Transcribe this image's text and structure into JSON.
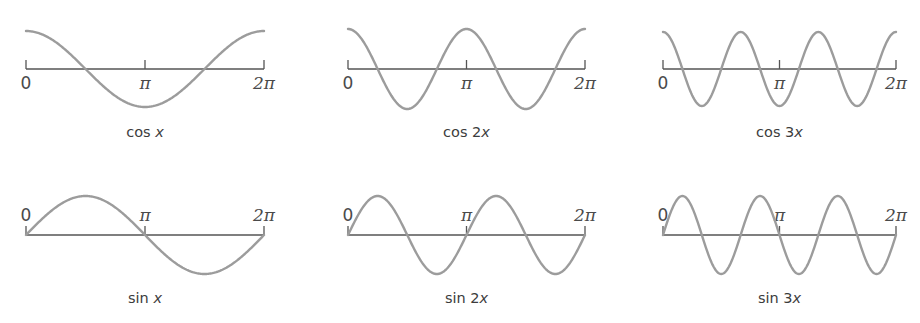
{
  "figure": {
    "colors": {
      "curve": "#9c9c9c",
      "axis": "#555555",
      "text": "#3c3c3c"
    }
  },
  "chart_data": [
    {
      "type": "line",
      "title": "cos x",
      "caption": {
        "fn": "cos",
        "coef": "",
        "var": "x"
      },
      "function": "cos",
      "frequency": 1,
      "xlim": [
        0,
        6.2832
      ],
      "ylim": [
        -1,
        1
      ],
      "x_ticks": [
        0,
        3.1416,
        6.2832
      ],
      "tick_labels": [
        "0",
        "π",
        "2π"
      ],
      "tick_label_position": "below",
      "grid": false
    },
    {
      "type": "line",
      "title": "cos 2x",
      "caption": {
        "fn": "cos",
        "coef": "2",
        "var": "x"
      },
      "function": "cos",
      "frequency": 2,
      "xlim": [
        0,
        6.2832
      ],
      "ylim": [
        -1,
        1
      ],
      "x_ticks": [
        0,
        3.1416,
        6.2832
      ],
      "tick_labels": [
        "0",
        "π",
        "2π"
      ],
      "tick_label_position": "below",
      "grid": false
    },
    {
      "type": "line",
      "title": "cos 3x",
      "caption": {
        "fn": "cos",
        "coef": "3",
        "var": "x"
      },
      "function": "cos",
      "frequency": 3,
      "xlim": [
        0,
        6.2832
      ],
      "ylim": [
        -1,
        1
      ],
      "x_ticks": [
        0,
        3.1416,
        6.2832
      ],
      "tick_labels": [
        "0",
        "π",
        "2π"
      ],
      "tick_label_position": "below",
      "grid": false
    },
    {
      "type": "line",
      "title": "sin x",
      "caption": {
        "fn": "sin",
        "coef": "",
        "var": "x"
      },
      "function": "sin",
      "frequency": 1,
      "xlim": [
        0,
        6.2832
      ],
      "ylim": [
        -1,
        1
      ],
      "x_ticks": [
        0,
        3.1416,
        6.2832
      ],
      "tick_labels": [
        "0",
        "π",
        "2π"
      ],
      "tick_label_position": "above",
      "grid": false
    },
    {
      "type": "line",
      "title": "sin 2x",
      "caption": {
        "fn": "sin",
        "coef": "2",
        "var": "x"
      },
      "function": "sin",
      "frequency": 2,
      "xlim": [
        0,
        6.2832
      ],
      "ylim": [
        -1,
        1
      ],
      "x_ticks": [
        0,
        3.1416,
        6.2832
      ],
      "tick_labels": [
        "0",
        "π",
        "2π"
      ],
      "tick_label_position": "above",
      "grid": false
    },
    {
      "type": "line",
      "title": "sin 3x",
      "caption": {
        "fn": "sin",
        "coef": "3",
        "var": "x"
      },
      "function": "sin",
      "frequency": 3,
      "xlim": [
        0,
        6.2832
      ],
      "ylim": [
        -1,
        1
      ],
      "x_ticks": [
        0,
        3.1416,
        6.2832
      ],
      "tick_labels": [
        "0",
        "π",
        "2π"
      ],
      "tick_label_position": "above",
      "grid": false
    }
  ]
}
